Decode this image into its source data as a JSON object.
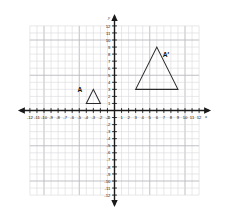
{
  "figure": {
    "type": "coordinate-plane-dilation",
    "background_color": "#ffffff",
    "grid_color": "#d8d8dc",
    "grid_major_color": "#b9b9c0",
    "axis_color": "#1a1a1a",
    "shape_color": "#2b2b2b",
    "label_color": "#111111"
  },
  "chart_data": {
    "type": "scatter",
    "title": "",
    "xlabel": "x",
    "ylabel": "y",
    "xlim": [
      -12,
      12
    ],
    "ylim": [
      -12,
      12
    ],
    "grid": true,
    "legend_position": "none",
    "x_tick_labels": [
      "-12",
      "-11",
      "-10",
      "-9",
      "-8",
      "-7",
      "-6",
      "-5",
      "-4",
      "-3",
      "-2",
      "-1",
      "1",
      "2",
      "3",
      "4",
      "5",
      "6",
      "7",
      "8",
      "9",
      "10",
      "11",
      "12"
    ],
    "y_tick_labels": [
      "12",
      "11",
      "10",
      "9",
      "8",
      "7",
      "6",
      "5",
      "4",
      "3",
      "2",
      "1",
      "-1",
      "-2",
      "-3",
      "-4",
      "-5",
      "-6",
      "-7",
      "-8",
      "-9",
      "-10",
      "-11",
      "-12"
    ],
    "shapes": [
      {
        "name": "A",
        "label": "A",
        "kind": "triangle",
        "vertices": [
          [
            -4,
            1
          ],
          [
            -2,
            1
          ],
          [
            -3,
            3
          ]
        ],
        "label_position": [
          -4.9,
          2.6
        ]
      },
      {
        "name": "A-prime",
        "label": "A′",
        "kind": "triangle",
        "vertices": [
          [
            3,
            3
          ],
          [
            9,
            3
          ],
          [
            6,
            9
          ]
        ],
        "label_position": [
          7.3,
          7.6
        ]
      }
    ]
  }
}
